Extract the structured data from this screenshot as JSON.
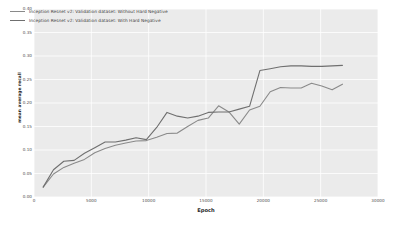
{
  "chart_data": {
    "type": "line",
    "title": "",
    "xlabel": "Epoch",
    "ylabel": "mean average recall",
    "xlim": [
      0,
      30000
    ],
    "ylim": [
      0.0,
      0.4
    ],
    "grid": true,
    "legend_position": "upper left",
    "xticks": [
      0,
      5000,
      10000,
      15000,
      20000,
      25000,
      30000
    ],
    "xtick_labels": [
      "0",
      "5000",
      "10000",
      "15000",
      "20000",
      "25000",
      "30000"
    ],
    "yticks": [
      0.0,
      0.05,
      0.1,
      0.15,
      0.2,
      0.25,
      0.3,
      0.35,
      0.4
    ],
    "ytick_labels": [
      "0.00",
      "0.05",
      "0.10",
      "0.15",
      "0.20",
      "0.25",
      "0.30",
      "0.35",
      "0.40"
    ],
    "series": [
      {
        "name": "Inception Resnet v2: Validation dataset: Without Hard Negative",
        "color": "#8a8a8a",
        "x": [
          800,
          1700,
          2600,
          3500,
          4400,
          5300,
          6200,
          7100,
          8000,
          8900,
          9800,
          10700,
          11600,
          12500,
          13400,
          14300,
          15200,
          16100,
          17000,
          17900,
          18800,
          19700,
          20600,
          21500,
          22400,
          23300,
          24200,
          25100,
          26000,
          26900
        ],
        "values": [
          0.021,
          0.049,
          0.063,
          0.072,
          0.08,
          0.094,
          0.103,
          0.11,
          0.115,
          0.119,
          0.12,
          0.127,
          0.135,
          0.136,
          0.15,
          0.163,
          0.168,
          0.194,
          0.181,
          0.155,
          0.185,
          0.193,
          0.224,
          0.233,
          0.232,
          0.232,
          0.242,
          0.236,
          0.228,
          0.24
        ]
      },
      {
        "name": "Inception Resnet v2: Validation dataset: With Hard Negative",
        "color": "#6f6f6f",
        "x": [
          800,
          1700,
          2600,
          3500,
          4400,
          5300,
          6200,
          7100,
          8000,
          8900,
          9800,
          10700,
          11600,
          12500,
          13400,
          14300,
          15200,
          16100,
          17000,
          17900,
          18800,
          19700,
          20600,
          21500,
          22400,
          23300,
          24200,
          25100,
          26000,
          26900
        ],
        "values": [
          0.021,
          0.058,
          0.076,
          0.078,
          0.093,
          0.105,
          0.117,
          0.117,
          0.121,
          0.126,
          0.122,
          0.148,
          0.18,
          0.172,
          0.168,
          0.172,
          0.18,
          0.181,
          0.181,
          0.187,
          0.193,
          0.269,
          0.273,
          0.277,
          0.279,
          0.279,
          0.278,
          0.278,
          0.279,
          0.28
        ]
      }
    ]
  },
  "legend": {
    "entries": [
      {
        "label": "Inception Resnet v2: Validation dataset: Without Hard Negative",
        "color": "#8a8a8a"
      },
      {
        "label": "Inception Resnet v2: Validation dataset: With Hard Negative",
        "color": "#6f6f6f"
      }
    ]
  },
  "style": {
    "plot_background": "#ebebeb",
    "grid_color": "#ffffff",
    "figure_background": "#ffffff",
    "tick_color": "#4d4d4d"
  }
}
